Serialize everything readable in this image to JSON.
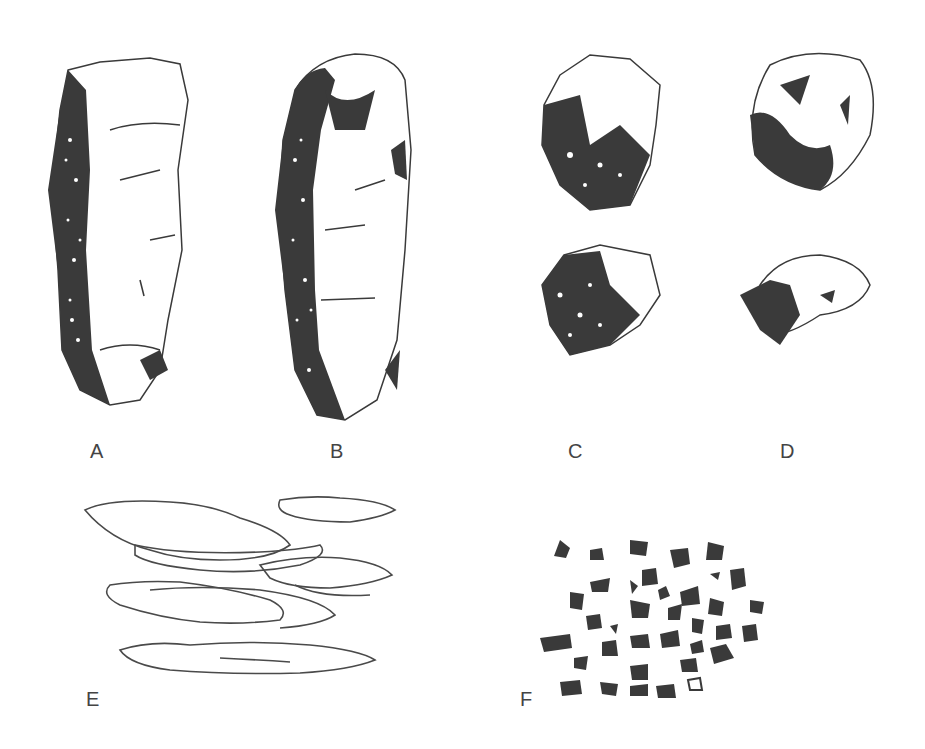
{
  "figure": {
    "panels": [
      {
        "id": "A",
        "label": "A",
        "shape": "prismatic-column"
      },
      {
        "id": "B",
        "label": "B",
        "shape": "columnar-column"
      },
      {
        "id": "C",
        "label": "C",
        "shape": "angular-blocky-aggregates"
      },
      {
        "id": "D",
        "label": "D",
        "shape": "subangular-blocky-aggregates"
      },
      {
        "id": "E",
        "label": "E",
        "shape": "platy-layers"
      },
      {
        "id": "F",
        "label": "F",
        "shape": "granular-crumbs"
      }
    ],
    "colors": {
      "ink": "#3a3a3a",
      "paper": "#ffffff",
      "label": "#444444"
    }
  }
}
